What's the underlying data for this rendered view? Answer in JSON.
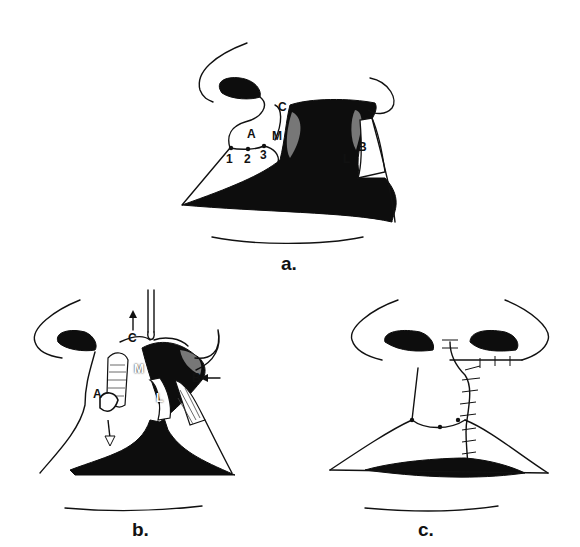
{
  "figure": {
    "panels": [
      {
        "id": "a",
        "caption": "a.",
        "labels": {
          "A": "A",
          "B": "B",
          "C": "C",
          "M": "M",
          "L": "L",
          "p1": "1",
          "p2": "2",
          "p3": "3"
        }
      },
      {
        "id": "b",
        "caption": "b.",
        "labels": {
          "A": "A",
          "B": "B",
          "C": "C",
          "M": "M",
          "L": "L"
        },
        "arrows": [
          "up-arrow-C",
          "left-arrow-B",
          "down-arrow-A"
        ]
      },
      {
        "id": "c",
        "caption": "c."
      }
    ]
  }
}
